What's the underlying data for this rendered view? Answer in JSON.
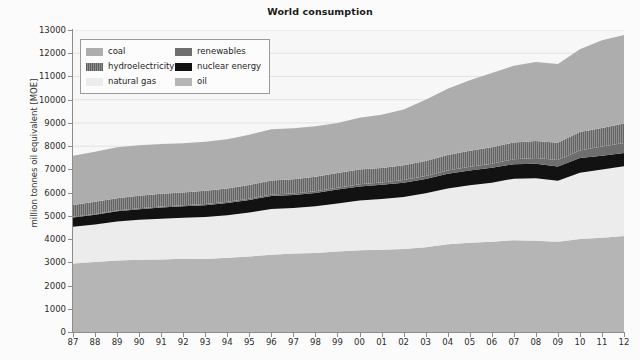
{
  "chart_data": {
    "type": "area",
    "stacked": true,
    "title": "World consumption",
    "xlabel": "",
    "ylabel": "million tonnes oil equivalent [MOE]",
    "ylim": [
      0,
      13000
    ],
    "ytick_step": 1000,
    "yticks": [
      0,
      1000,
      2000,
      3000,
      4000,
      5000,
      6000,
      7000,
      8000,
      9000,
      10000,
      11000,
      12000,
      13000
    ],
    "grid": true,
    "legend_position": "upper left",
    "x": [
      1987,
      1988,
      1989,
      1990,
      1991,
      1992,
      1993,
      1994,
      1995,
      1996,
      1997,
      1998,
      1999,
      2000,
      2001,
      2002,
      2003,
      2004,
      2005,
      2006,
      2007,
      2008,
      2009,
      2010,
      2011,
      2012
    ],
    "categories": [
      "87",
      "88",
      "89",
      "90",
      "91",
      "92",
      "93",
      "94",
      "95",
      "96",
      "97",
      "98",
      "99",
      "00",
      "01",
      "02",
      "03",
      "04",
      "05",
      "06",
      "07",
      "08",
      "09",
      "10",
      "11",
      "12"
    ],
    "stack_order_bottom_to_top": [
      "oil",
      "natural gas",
      "nuclear energy",
      "renewables",
      "hydroelectricity",
      "coal"
    ],
    "series": [
      {
        "name": "oil",
        "color": "#b5b5b5",
        "values": [
          2950,
          3010,
          3080,
          3110,
          3120,
          3150,
          3140,
          3200,
          3250,
          3330,
          3380,
          3400,
          3470,
          3520,
          3540,
          3570,
          3650,
          3780,
          3840,
          3890,
          3950,
          3930,
          3880,
          4000,
          4060,
          4130
        ]
      },
      {
        "name": "natural gas",
        "color": "#ececec",
        "values": [
          1580,
          1620,
          1680,
          1720,
          1760,
          1770,
          1810,
          1830,
          1890,
          1960,
          1960,
          2010,
          2060,
          2140,
          2180,
          2240,
          2320,
          2400,
          2480,
          2540,
          2650,
          2690,
          2630,
          2860,
          2930,
          3010
        ]
      },
      {
        "name": "nuclear energy",
        "color": "#121212",
        "values": [
          400,
          420,
          440,
          455,
          480,
          490,
          510,
          525,
          545,
          565,
          560,
          575,
          600,
          605,
          615,
          620,
          615,
          630,
          635,
          635,
          625,
          620,
          610,
          625,
          600,
          560
        ]
      },
      {
        "name": "renewables",
        "color": "#6e6e6e",
        "values": [
          30,
          32,
          35,
          38,
          42,
          45,
          48,
          52,
          56,
          60,
          65,
          72,
          80,
          90,
          100,
          112,
          126,
          142,
          160,
          182,
          210,
          245,
          280,
          330,
          390,
          440
        ]
      },
      {
        "name": "hydroelectricity",
        "color": "#8f8f8f",
        "values": [
          510,
          520,
          525,
          540,
          545,
          555,
          570,
          565,
          590,
          610,
          610,
          625,
          630,
          640,
          620,
          640,
          645,
          670,
          690,
          710,
          720,
          740,
          750,
          790,
          800,
          830
        ]
      },
      {
        "name": "coal",
        "color": "#adadad",
        "values": [
          2120,
          2160,
          2190,
          2180,
          2150,
          2120,
          2110,
          2120,
          2160,
          2200,
          2200,
          2180,
          2160,
          2230,
          2300,
          2400,
          2640,
          2850,
          3030,
          3190,
          3310,
          3400,
          3390,
          3570,
          3780,
          3820
        ]
      }
    ]
  },
  "legend": {
    "entries": [
      {
        "label": "coal",
        "swatch": "coal-swatch"
      },
      {
        "label": "renewables",
        "swatch": "renewables-swatch"
      },
      {
        "label": "hydroelectricity",
        "swatch": "hydroelectricity-swatch"
      },
      {
        "label": "nuclear energy",
        "swatch": "nuclear-energy-swatch"
      },
      {
        "label": "natural gas",
        "swatch": "natural-gas-swatch"
      },
      {
        "label": "oil",
        "swatch": "oil-swatch"
      }
    ]
  },
  "colors": {
    "coal": "#adadad",
    "hydroelectricity": "#8f8f8f",
    "natural_gas": "#ececec",
    "renewables": "#6e6e6e",
    "nuclear_energy": "#121212",
    "oil": "#b5b5b5",
    "background": "#fbfbfb",
    "plot_background": "#f7f7f7",
    "axis": "#8c8c8c",
    "grid": "#e2e2e2",
    "text": "#2b2b2b"
  }
}
